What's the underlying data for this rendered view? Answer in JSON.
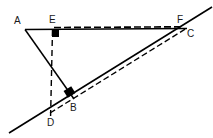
{
  "figure": {
    "background_color": "#ffffff",
    "stroke_color": "#000000",
    "label_color": "#1a1a1a",
    "width": 213,
    "height": 138,
    "points": [
      {
        "id": "A",
        "label": "A",
        "x": 25,
        "y": 30,
        "label_x": 14,
        "label_y": 16
      },
      {
        "id": "E",
        "label": "E",
        "x": 52,
        "y": 29,
        "label_x": 49,
        "label_y": 15
      },
      {
        "id": "F",
        "label": "F",
        "x": 182,
        "y": 28,
        "label_x": 177,
        "label_y": 15
      },
      {
        "id": "C",
        "label": "C",
        "x": 188,
        "y": 34,
        "label_x": 186,
        "label_y": 28
      },
      {
        "id": "B",
        "label": "B",
        "x": 71,
        "y": 96,
        "label_x": 70,
        "label_y": 104
      },
      {
        "id": "D",
        "label": "D",
        "x": 50,
        "y": 116,
        "label_x": 47,
        "label_y": 118
      }
    ],
    "segments": [
      {
        "name": "segment-A-F",
        "style": "solid",
        "from": "A",
        "to": "F",
        "x1": 25,
        "y1": 29,
        "x2": 186,
        "y2": 28
      },
      {
        "name": "segment-A-B",
        "style": "solid",
        "from": "A",
        "to": "B",
        "x1": 25,
        "y1": 29,
        "x2": 74,
        "y2": 99
      },
      {
        "name": "line-D-C-extended",
        "style": "solid",
        "from": "D",
        "to": "C",
        "x1": 9,
        "y1": 133,
        "x2": 212,
        "y2": 7
      },
      {
        "name": "segment-E-F-dashed",
        "style": "dashed",
        "from": "E",
        "to": "F",
        "x1": 52,
        "y1": 28,
        "x2": 183,
        "y2": 27
      },
      {
        "name": "segment-E-D-dashed",
        "style": "dashed",
        "from": "E",
        "to": "D",
        "x1": 52,
        "y1": 30,
        "x2": 50,
        "y2": 118
      },
      {
        "name": "segment-D-C-dashed",
        "style": "dashed",
        "from": "D",
        "to": "C",
        "x1": 50,
        "y1": 114,
        "x2": 187,
        "y2": 29
      }
    ],
    "right_angles": [
      {
        "name": "right-angle-at-E",
        "vertex": "E",
        "x": 52,
        "y": 29,
        "size": 7
      },
      {
        "name": "right-angle-at-B",
        "vertex": "B",
        "x": 66,
        "y": 89,
        "size": 8,
        "rotation": -33
      }
    ]
  }
}
